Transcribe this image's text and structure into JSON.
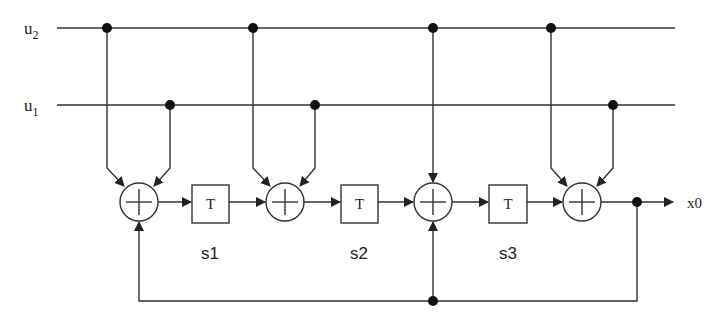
{
  "diagram": {
    "type": "convolutional-encoder",
    "inputs": [
      {
        "name": "u2",
        "base": "u",
        "sub": "2"
      },
      {
        "name": "u1",
        "base": "u",
        "sub": "1"
      }
    ],
    "delay_label": "T",
    "states": [
      "s1",
      "s2",
      "s3"
    ],
    "output_label": "x0",
    "adder_symbol": "+",
    "colors": {
      "stroke": "#333333",
      "background": "#ffffff"
    }
  }
}
